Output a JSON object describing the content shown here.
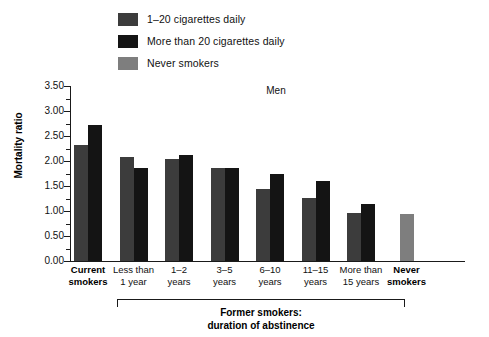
{
  "chart_data": {
    "type": "bar",
    "title": "Men",
    "xlabel": "Former smokers: duration of abstinence",
    "ylabel": "Mortality ratio",
    "ylim": [
      0.0,
      3.5
    ],
    "ytick_labels": [
      "0.00",
      "0.50",
      "1.00",
      "1.50",
      "2.00",
      "2.50",
      "3.00",
      "3.50"
    ],
    "ytick_values": [
      0.0,
      0.5,
      1.0,
      1.5,
      2.0,
      2.5,
      3.0,
      3.5
    ],
    "minor_tick_step": 0.25,
    "grid": false,
    "legend_position": "top-left",
    "categories": [
      "Current smokers",
      "Less than 1 year",
      "1–2 years",
      "3–5 years",
      "6–10 years",
      "11–15 years",
      "More than 15 years",
      "Never smokers"
    ],
    "category_lines": [
      [
        "Current",
        "smokers"
      ],
      [
        "Less than",
        "1 year"
      ],
      [
        "1–2",
        "years"
      ],
      [
        "3–5",
        "years"
      ],
      [
        "6–10",
        "years"
      ],
      [
        "11–15",
        "years"
      ],
      [
        "More than",
        "15 years"
      ],
      [
        "Never",
        "smokers"
      ]
    ],
    "category_bold": [
      true,
      false,
      false,
      false,
      false,
      false,
      false,
      true
    ],
    "series": [
      {
        "name": "1–20 cigarettes daily",
        "color": "#3c3c3c",
        "values": [
          2.32,
          2.08,
          2.04,
          1.86,
          1.44,
          1.26,
          0.96,
          null
        ]
      },
      {
        "name": "More than 20 cigarettes daily",
        "color": "#141414",
        "values": [
          2.72,
          1.86,
          2.12,
          1.86,
          1.74,
          1.6,
          1.14,
          null
        ]
      },
      {
        "name": "Never smokers",
        "color": "#7e7e7e",
        "values": [
          null,
          null,
          null,
          null,
          null,
          null,
          null,
          0.95
        ]
      }
    ],
    "bracket_caption_lines": [
      "Former smokers:",
      "duration of abstinence"
    ],
    "bracket_spans_categories": [
      1,
      2,
      3,
      4,
      5,
      6
    ]
  },
  "legend": {
    "items": [
      {
        "label": "1–20 cigarettes daily",
        "color": "#3c3c3c"
      },
      {
        "label": "More than 20 cigarettes daily",
        "color": "#141414"
      },
      {
        "label": "Never smokers",
        "color": "#7e7e7e"
      }
    ]
  }
}
